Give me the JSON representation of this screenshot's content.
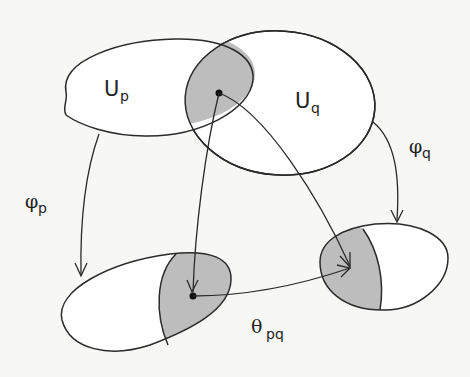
{
  "diagram": {
    "type": "manifold-chart-transition",
    "colors": {
      "background": "#f7f7f5",
      "stroke": "#2a2a2a",
      "overlap_fill": "#bdbdbd",
      "region_fill": "#ffffff"
    },
    "labels": {
      "up": {
        "main": "U",
        "sub": "p"
      },
      "uq": {
        "main": "U",
        "sub": "q"
      },
      "phi_p": {
        "main": "φ",
        "sub": "p"
      },
      "phi_q": {
        "main": "φ",
        "sub": "q"
      },
      "theta_pq": {
        "main": "θ",
        "sub": "pq"
      }
    },
    "nodes": [
      {
        "id": "U_p",
        "label": "U_p",
        "kind": "open-set"
      },
      {
        "id": "U_q",
        "label": "U_q",
        "kind": "open-set"
      },
      {
        "id": "overlap",
        "label": "U_p ∩ U_q",
        "kind": "shaded-intersection"
      },
      {
        "id": "phi_p_image",
        "label": "φ_p(U_p)",
        "kind": "chart-image"
      },
      {
        "id": "phi_q_image",
        "label": "φ_q(U_q)",
        "kind": "chart-image"
      }
    ],
    "edges": [
      {
        "from": "U_p",
        "to": "phi_p_image",
        "label": "φ_p"
      },
      {
        "from": "U_q",
        "to": "phi_q_image",
        "label": "φ_q"
      },
      {
        "from": "overlap",
        "to": "phi_p_image",
        "label": ""
      },
      {
        "from": "overlap",
        "to": "phi_q_image",
        "label": ""
      },
      {
        "from": "phi_p_image",
        "to": "phi_q_image",
        "label": "θ_pq"
      }
    ]
  }
}
